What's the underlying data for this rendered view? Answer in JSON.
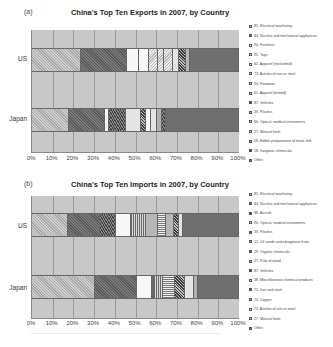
{
  "chart_data": [
    {
      "type": "bar",
      "orientation": "horizontal",
      "stacked": "percent",
      "panel_label": "(a)",
      "title": "China's Top Ten Exports in 2007, by Country",
      "categories": [
        "US",
        "Japan"
      ],
      "xlabel": "",
      "ylabel": "",
      "xlim": [
        0,
        100
      ],
      "x_ticks": [
        "0%",
        "10%",
        "20%",
        "30%",
        "40%",
        "50%",
        "60%",
        "70%",
        "80%",
        "90%",
        "100%"
      ],
      "grid": true,
      "legend_position": "right",
      "series": [
        {
          "name": "85. Electrical machinery",
          "pattern": "p-diag-light",
          "values": [
            23.5,
            18.0
          ]
        },
        {
          "name": "84. Nuclear and mechanical appliances",
          "pattern": "p-diag-dark",
          "values": [
            22.5,
            17.5
          ]
        },
        {
          "name": "94. Furniture",
          "pattern": "p-white",
          "values": [
            5.8,
            1.5
          ]
        },
        {
          "name": "95. Toys",
          "pattern": "p-white",
          "values": [
            4.7,
            0
          ]
        },
        {
          "name": "62. Apparel (not knitted)",
          "pattern": "p-zigzag",
          "values": [
            4.2,
            8.5
          ]
        },
        {
          "name": "73. Articles of iron or steel",
          "pattern": "p-zigzag",
          "values": [
            3.1,
            0
          ]
        },
        {
          "name": "64. Footwear",
          "pattern": "p-zigzag",
          "values": [
            4.2,
            0
          ]
        },
        {
          "name": "61. Apparel (knitted)",
          "pattern": "p-lightgray",
          "values": [
            3.0,
            7.0
          ]
        },
        {
          "name": "87. Vehicles",
          "pattern": "p-checker",
          "values": [
            3.4,
            2.5
          ]
        },
        {
          "name": "39. Plastics",
          "pattern": "p-mid",
          "values": [
            1.9,
            0
          ]
        },
        {
          "name": "90. Optical, medical instruments",
          "pattern": "p-white",
          "values": [
            0,
            2.5
          ]
        },
        {
          "name": "27. Mineral fuels",
          "pattern": "p-lightgray",
          "values": [
            0,
            3.0
          ]
        },
        {
          "name": "16. Edible preparations of meat, fish",
          "pattern": "p-dots",
          "values": [
            0,
            2.5
          ]
        },
        {
          "name": "28. Inorganic chemicals",
          "pattern": "p-darkdots",
          "values": [
            0,
            2.0
          ]
        },
        {
          "name": "Other",
          "pattern": "p-other",
          "values": [
            23.7,
            35.0
          ]
        }
      ]
    },
    {
      "type": "bar",
      "orientation": "horizontal",
      "stacked": "percent",
      "panel_label": "(b)",
      "title": "China's Top Ten Imports in 2007, by Country",
      "categories": [
        "US",
        "Japan"
      ],
      "xlabel": "",
      "ylabel": "",
      "xlim": [
        0,
        100
      ],
      "x_ticks": [
        "0%",
        "10%",
        "20%",
        "30%",
        "40%",
        "50%",
        "60%",
        "70%",
        "80%",
        "90%",
        "100%"
      ],
      "grid": true,
      "legend_position": "right",
      "series": [
        {
          "name": "85. Electrical machinery",
          "pattern": "p-diag-light",
          "values": [
            17.5,
            30.5
          ]
        },
        {
          "name": "84. Nuclear and mechanical appliances",
          "pattern": "p-diag-dark",
          "values": [
            15.5,
            20.0
          ]
        },
        {
          "name": "88. Aircraft",
          "pattern": "p-darkdots",
          "values": [
            7.5,
            0
          ]
        },
        {
          "name": "90. Optical, medical instruments",
          "pattern": "p-white",
          "values": [
            7.5,
            7.5
          ]
        },
        {
          "name": "39. Plastics",
          "pattern": "p-vstripe",
          "values": [
            7.0,
            1.0
          ]
        },
        {
          "name": "12. Oil seeds and oleaginous fruits",
          "pattern": "p-mid",
          "values": [
            6.0,
            0
          ]
        },
        {
          "name": "29. Organic chemicals",
          "pattern": "p-hstripe",
          "values": [
            4.0,
            4.5
          ]
        },
        {
          "name": "47. Pulp of wood",
          "pattern": "p-mid",
          "values": [
            3.5,
            0
          ]
        },
        {
          "name": "87. Vehicles",
          "pattern": "p-checker",
          "values": [
            2.5,
            5.5
          ]
        },
        {
          "name": "38. Miscellaneous chemical products",
          "pattern": "p-lightgray",
          "values": [
            0,
            5.0
          ]
        },
        {
          "name": "72. Iron and steel",
          "pattern": "p-vstripe",
          "values": [
            0,
            4.5
          ]
        },
        {
          "name": "74. Copper",
          "pattern": "p-mid",
          "values": [
            0,
            1.5
          ]
        },
        {
          "name": "73. Articles of iron or steel",
          "pattern": "p-zigzag",
          "values": [
            0,
            0
          ]
        },
        {
          "name": "27. Mineral fuels",
          "pattern": "p-lightgray",
          "values": [
            2.0,
            0
          ]
        },
        {
          "name": "Other",
          "pattern": "p-other",
          "values": [
            27.0,
            20.0
          ]
        }
      ]
    }
  ],
  "exports": {
    "panel_label": "(a)",
    "title": "China's Top Ten Exports in 2007, by Country",
    "category_labels": [
      "US",
      "Japan"
    ],
    "x_ticks": [
      "0%",
      "10%",
      "20%",
      "30%",
      "40%",
      "50%",
      "60%",
      "70%",
      "80%",
      "90%",
      "100%"
    ],
    "legend": [
      {
        "label": "85. Electrical machinery",
        "pattern": "p-diag-light"
      },
      {
        "label": "84. Nuclear and mechanical appliances",
        "pattern": "p-diag-dark"
      },
      {
        "label": "94. Furniture",
        "pattern": "p-white"
      },
      {
        "label": "95. Toys",
        "pattern": "p-white"
      },
      {
        "label": "62. Apparel (not knitted)",
        "pattern": "p-zigzag"
      },
      {
        "label": "73. Articles of iron or steel",
        "pattern": "p-zigzag"
      },
      {
        "label": "64. Footwear",
        "pattern": "p-zigzag"
      },
      {
        "label": "61. Apparel (knitted)",
        "pattern": "p-lightgray"
      },
      {
        "label": "87. Vehicles",
        "pattern": "p-checker"
      },
      {
        "label": "39. Plastics",
        "pattern": "p-mid"
      },
      {
        "label": "90. Optical, medical instruments",
        "pattern": "p-white"
      },
      {
        "label": "27. Mineral fuels",
        "pattern": "p-lightgray"
      },
      {
        "label": "16. Edible preparations of meat, fish",
        "pattern": "p-dots"
      },
      {
        "label": "28. Inorganic chemicals",
        "pattern": "p-darkdots"
      },
      {
        "label": "Other",
        "pattern": "p-other"
      }
    ],
    "bars": [
      {
        "label": "US",
        "segments": [
          {
            "w": 23.5,
            "p": "p-diag-light"
          },
          {
            "w": 22.5,
            "p": "p-diag-dark"
          },
          {
            "w": 5.8,
            "p": "p-white"
          },
          {
            "w": 4.7,
            "p": "p-white"
          },
          {
            "w": 4.2,
            "p": "p-zigzag"
          },
          {
            "w": 3.1,
            "p": "p-zigzag"
          },
          {
            "w": 4.2,
            "p": "p-zigzag"
          },
          {
            "w": 3.0,
            "p": "p-lightgray"
          },
          {
            "w": 3.4,
            "p": "p-checker"
          },
          {
            "w": 1.9,
            "p": "p-mid"
          },
          {
            "w": 23.7,
            "p": "p-other"
          }
        ]
      },
      {
        "label": "Japan",
        "segments": [
          {
            "w": 18.0,
            "p": "p-diag-light"
          },
          {
            "w": 17.5,
            "p": "p-diag-dark"
          },
          {
            "w": 1.5,
            "p": "p-white"
          },
          {
            "w": 8.5,
            "p": "p-darkdots"
          },
          {
            "w": 7.0,
            "p": "p-lightgray"
          },
          {
            "w": 2.5,
            "p": "p-checker"
          },
          {
            "w": 2.5,
            "p": "p-white"
          },
          {
            "w": 3.0,
            "p": "p-lightgray"
          },
          {
            "w": 2.5,
            "p": "p-dots"
          },
          {
            "w": 2.0,
            "p": "p-darkdots"
          },
          {
            "w": 35.0,
            "p": "p-other"
          }
        ]
      }
    ]
  },
  "imports": {
    "panel_label": "(b)",
    "title": "China's Top Ten Imports in 2007, by Country",
    "category_labels": [
      "US",
      "Japan"
    ],
    "x_ticks": [
      "0%",
      "10%",
      "20%",
      "30%",
      "40%",
      "50%",
      "60%",
      "70%",
      "80%",
      "90%",
      "100%"
    ],
    "legend": [
      {
        "label": "85. Electrical machinery",
        "pattern": "p-diag-light"
      },
      {
        "label": "84. Nuclear and mechanical appliances",
        "pattern": "p-diag-dark"
      },
      {
        "label": "88. Aircraft",
        "pattern": "p-darkdots"
      },
      {
        "label": "90. Optical, medical instruments",
        "pattern": "p-white"
      },
      {
        "label": "39. Plastics",
        "pattern": "p-vstripe"
      },
      {
        "label": "12. Oil seeds and oleaginous fruits",
        "pattern": "p-mid"
      },
      {
        "label": "29. Organic chemicals",
        "pattern": "p-hstripe"
      },
      {
        "label": "47. Pulp of wood",
        "pattern": "p-mid"
      },
      {
        "label": "87. Vehicles",
        "pattern": "p-checker"
      },
      {
        "label": "38. Miscellaneous chemical products",
        "pattern": "p-lightgray"
      },
      {
        "label": "72. Iron and steel",
        "pattern": "p-vstripe"
      },
      {
        "label": "74. Copper",
        "pattern": "p-mid"
      },
      {
        "label": "73. Articles of iron or steel",
        "pattern": "p-zigzag"
      },
      {
        "label": "27. Mineral fuels",
        "pattern": "p-lightgray"
      },
      {
        "label": "Other",
        "pattern": "p-other"
      }
    ],
    "bars": [
      {
        "label": "US",
        "segments": [
          {
            "w": 17.5,
            "p": "p-diag-light"
          },
          {
            "w": 15.5,
            "p": "p-diag-dark"
          },
          {
            "w": 7.5,
            "p": "p-darkdots"
          },
          {
            "w": 7.5,
            "p": "p-white"
          },
          {
            "w": 7.0,
            "p": "p-vstripe"
          },
          {
            "w": 6.0,
            "p": "p-mid"
          },
          {
            "w": 4.0,
            "p": "p-hstripe"
          },
          {
            "w": 3.5,
            "p": "p-mid"
          },
          {
            "w": 2.5,
            "p": "p-checker"
          },
          {
            "w": 2.0,
            "p": "p-lightgray"
          },
          {
            "w": 27.0,
            "p": "p-other"
          }
        ]
      },
      {
        "label": "Japan",
        "segments": [
          {
            "w": 30.5,
            "p": "p-diag-light"
          },
          {
            "w": 20.0,
            "p": "p-diag-dark"
          },
          {
            "w": 7.5,
            "p": "p-white"
          },
          {
            "w": 1.0,
            "p": "p-vstripe"
          },
          {
            "w": 4.5,
            "p": "p-vstripe"
          },
          {
            "w": 5.5,
            "p": "p-hstripe"
          },
          {
            "w": 5.0,
            "p": "p-checker"
          },
          {
            "w": 4.5,
            "p": "p-lightgray"
          },
          {
            "w": 1.5,
            "p": "p-dots"
          },
          {
            "w": 20.0,
            "p": "p-other"
          }
        ]
      }
    ]
  }
}
